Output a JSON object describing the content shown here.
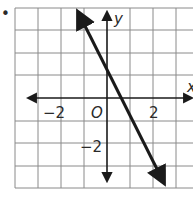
{
  "bullet": "•",
  "graph": {
    "axis_labels": {
      "x": "x",
      "y": "y"
    },
    "origin_label": "O",
    "tick_labels": {
      "x_neg": "−2",
      "x_pos": "2",
      "y_neg": "−2"
    },
    "grid": {
      "x_min": -4,
      "x_max": 3.7,
      "y_min": -4,
      "y_max": 4,
      "step": 1
    },
    "line": {
      "equation": "y = -2x + 1",
      "slope": -2,
      "y_intercept": 1,
      "x_intercept": 0.5,
      "from": [
        -1.4,
        3.9
      ],
      "to": [
        2.5,
        -3.8
      ]
    },
    "colors": {
      "grid": "#8a8a8a",
      "axis": "#1a1a1a",
      "line": "#1a1a1a"
    }
  }
}
